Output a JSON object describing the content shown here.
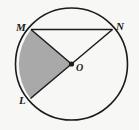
{
  "figure": {
    "type": "circle-with-shaded-sector",
    "background_color": "#f7f7f6",
    "stroke_color": "#1b1b1b",
    "shade_color": "#a9a9a9",
    "circle": {
      "center_x": 71.5,
      "center_y": 64,
      "radius": 56,
      "stroke_width": 1.6
    },
    "center_point": {
      "label": "O",
      "x": 71.5,
      "y": 64,
      "dot_radius": 2.6
    },
    "points": [
      {
        "label": "M",
        "x": 31,
        "y": 29.5
      },
      {
        "label": "N",
        "x": 112.5,
        "y": 29.5
      },
      {
        "label": "L",
        "x": 30.5,
        "y": 98.5
      }
    ],
    "segments": [
      {
        "name": "chord-MN",
        "from": "M",
        "to": "N"
      },
      {
        "name": "radius-OM",
        "from": "O",
        "to": "M"
      },
      {
        "name": "diameter-LN",
        "from": "L",
        "to": "N"
      }
    ],
    "shaded_sector": {
      "name": "sector-MOL",
      "from": "M",
      "to": "L",
      "vertex": "O",
      "fill": "#a9a9a9"
    },
    "labels": {
      "m": "M",
      "n": "N",
      "l": "L",
      "o": "O"
    }
  }
}
